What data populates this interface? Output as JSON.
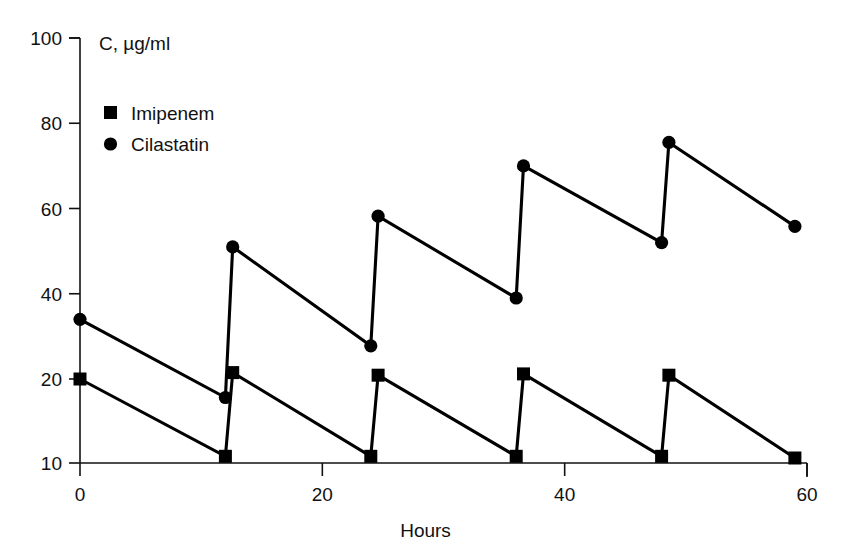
{
  "chart_data": {
    "type": "line",
    "title": "",
    "xlabel": "Hours",
    "ylabel": "C, µg/ml",
    "xlim": [
      0,
      60
    ],
    "ylim": [
      10,
      100
    ],
    "grid": false,
    "legend_position": "top-left",
    "y_axis_note": "broken axis: linear from 20 to 100, compressed segment from 10 to 20",
    "x_ticks": [
      0,
      20,
      40,
      60
    ],
    "x_tick_labels": [
      "0",
      "20",
      "40",
      "60"
    ],
    "y_ticks": [
      10,
      20,
      40,
      60,
      80,
      100
    ],
    "y_tick_labels": [
      "10",
      "20",
      "40",
      "60",
      "80",
      "100"
    ],
    "dose_interval_hours": 12,
    "series": [
      {
        "name": "Imipenem",
        "marker": "square",
        "color": "#000000",
        "x": [
          0,
          12,
          12.6,
          24,
          24.6,
          36,
          36.6,
          48,
          48.6,
          59
        ],
        "values": [
          20.0,
          10.8,
          21.5,
          10.8,
          20.9,
          10.8,
          21.2,
          10.8,
          20.9,
          10.6
        ]
      },
      {
        "name": "Cilastatin",
        "marker": "circle",
        "color": "#000000",
        "x": [
          0,
          12,
          12.6,
          24,
          24.6,
          36,
          36.6,
          48,
          48.6,
          59
        ],
        "values": [
          34.0,
          17.8,
          51.0,
          27.8,
          58.2,
          39.0,
          70.0,
          52.0,
          75.5,
          55.8
        ]
      }
    ]
  },
  "legend": {
    "items": [
      {
        "label": "Imipenem",
        "marker": "square"
      },
      {
        "label": "Cilastatin",
        "marker": "circle"
      }
    ]
  },
  "axes": {
    "y_title": "C, µg/ml",
    "x_title": "Hours"
  }
}
